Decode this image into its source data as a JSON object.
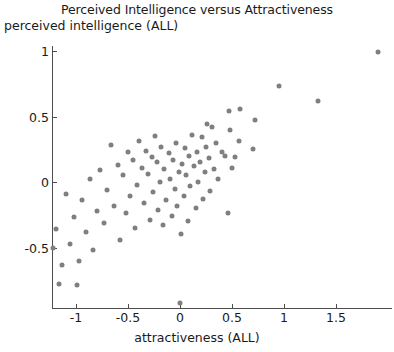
{
  "chart_data": {
    "type": "scatter",
    "title": "Perceived Intelligence versus Attractiveness",
    "xlabel": "attractiveness (ALL)",
    "ylabel": "perceived intelligence (ALL)",
    "xlim": [
      -1.27,
      1.95
    ],
    "ylim": [
      -0.97,
      1.15
    ],
    "grid": false,
    "legend": null,
    "marker_color": "#7f7f7f",
    "xticks": [
      -1,
      -0.5,
      0,
      0.5,
      1,
      1.5
    ],
    "xtick_labels": [
      "-1",
      "-0.5",
      "0",
      "0.5",
      "1",
      "1.5"
    ],
    "yticks": [
      -0.5,
      0,
      0.5,
      1
    ],
    "ytick_labels": [
      "-0.5",
      "0",
      "0.5",
      "1"
    ],
    "points": [
      [
        1.9,
        0.99
      ],
      [
        1.33,
        0.62
      ],
      [
        0.95,
        0.73
      ],
      [
        0.72,
        0.47
      ],
      [
        0.7,
        0.25
      ],
      [
        0.58,
        0.56
      ],
      [
        0.57,
        0.31
      ],
      [
        0.53,
        0.19
      ],
      [
        0.5,
        0.11
      ],
      [
        0.48,
        0.4
      ],
      [
        0.47,
        0.54
      ],
      [
        0.46,
        -0.24
      ],
      [
        0.43,
        0.2
      ],
      [
        0.4,
        0.23
      ],
      [
        0.37,
        0.02
      ],
      [
        0.35,
        0.3
      ],
      [
        0.33,
        0.1
      ],
      [
        0.31,
        0.42
      ],
      [
        0.29,
        -0.07
      ],
      [
        0.28,
        0.18
      ],
      [
        0.26,
        0.44
      ],
      [
        0.25,
        0.27
      ],
      [
        0.24,
        0.08
      ],
      [
        0.22,
        -0.13
      ],
      [
        0.21,
        0.34
      ],
      [
        0.19,
        0.15
      ],
      [
        0.17,
        0.0
      ],
      [
        0.16,
        0.23
      ],
      [
        0.15,
        -0.2
      ],
      [
        0.13,
        0.12
      ],
      [
        0.12,
        0.36
      ],
      [
        0.1,
        -0.03
      ],
      [
        0.09,
        0.2
      ],
      [
        0.08,
        -0.3
      ],
      [
        0.06,
        0.05
      ],
      [
        0.05,
        0.26
      ],
      [
        0.04,
        -0.11
      ],
      [
        0.02,
        0.14
      ],
      [
        0.01,
        -0.4
      ],
      [
        0.0,
        -0.92
      ],
      [
        -0.01,
        0.08
      ],
      [
        -0.03,
        -0.18
      ],
      [
        -0.04,
        0.3
      ],
      [
        -0.05,
        -0.05
      ],
      [
        -0.07,
        0.17
      ],
      [
        -0.08,
        -0.26
      ],
      [
        -0.1,
        0.02
      ],
      [
        -0.11,
        0.22
      ],
      [
        -0.13,
        -0.14
      ],
      [
        -0.15,
        0.1
      ],
      [
        -0.16,
        -0.33
      ],
      [
        -0.18,
        0.27
      ],
      [
        -0.19,
        0.0
      ],
      [
        -0.21,
        -0.21
      ],
      [
        -0.22,
        0.15
      ],
      [
        -0.24,
        0.35
      ],
      [
        -0.26,
        -0.08
      ],
      [
        -0.27,
        0.19
      ],
      [
        -0.29,
        -0.29
      ],
      [
        -0.31,
        0.06
      ],
      [
        -0.33,
        0.24
      ],
      [
        -0.35,
        -0.16
      ],
      [
        -0.37,
        0.11
      ],
      [
        -0.39,
        0.31
      ],
      [
        -0.41,
        -0.02
      ],
      [
        -0.43,
        -0.35
      ],
      [
        -0.45,
        0.17
      ],
      [
        -0.48,
        -0.11
      ],
      [
        -0.5,
        0.23
      ],
      [
        -0.52,
        -0.24
      ],
      [
        -0.55,
        0.05
      ],
      [
        -0.58,
        -0.44
      ],
      [
        -0.6,
        0.13
      ],
      [
        -0.63,
        -0.18
      ],
      [
        -0.66,
        0.28
      ],
      [
        -0.7,
        -0.06
      ],
      [
        -0.73,
        -0.31
      ],
      [
        -0.77,
        0.09
      ],
      [
        -0.8,
        -0.22
      ],
      [
        -0.84,
        -0.52
      ],
      [
        -0.87,
        0.02
      ],
      [
        -0.9,
        -0.38
      ],
      [
        -0.94,
        -0.14
      ],
      [
        -0.97,
        -0.6
      ],
      [
        -0.99,
        -0.79
      ],
      [
        -1.02,
        -0.27
      ],
      [
        -1.06,
        -0.47
      ],
      [
        -1.1,
        -0.09
      ],
      [
        -1.13,
        -0.63
      ],
      [
        -1.16,
        -0.78
      ],
      [
        -1.19,
        -0.36
      ],
      [
        -1.22,
        -0.5
      ]
    ]
  }
}
